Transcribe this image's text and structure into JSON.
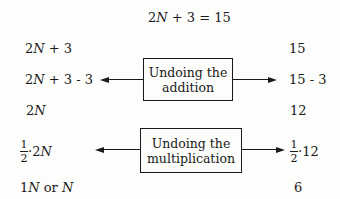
{
  "title": {
    "pre": "2",
    "var": "N",
    "post": " + 3 = 15"
  },
  "rows": {
    "r1": {
      "left_pre": "2",
      "left_var": "N",
      "left_post": " + 3",
      "right": "15"
    },
    "r2": {
      "left_pre": "2",
      "left_var": "N",
      "left_post": " + 3 - 3",
      "right": "15 - 3"
    },
    "r3": {
      "left_pre": "2",
      "left_var": "N",
      "right": "12"
    },
    "r4": {
      "frac_num": "1",
      "frac_den": "2",
      "left_post": "·2",
      "left_var": "N",
      "right_num": "1",
      "right_den": "2",
      "right_post": "·12"
    },
    "r5": {
      "left_pre": "1",
      "left_var": "N",
      "left_mid": " or ",
      "left_var2": "N",
      "right": "6"
    }
  },
  "boxes": {
    "addition": {
      "line1": "Undoing the",
      "line2": "addition"
    },
    "multiplication": {
      "line1": "Undoing the",
      "line2": "multiplication"
    }
  }
}
